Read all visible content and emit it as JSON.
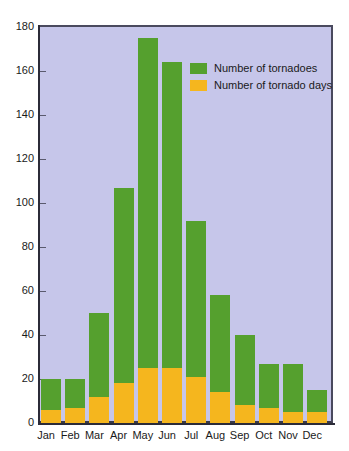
{
  "chart_data": {
    "type": "bar",
    "stacked": true,
    "title": "",
    "xlabel": "",
    "ylabel": "",
    "ylim": [
      0,
      180
    ],
    "ytick_step": 20,
    "yticks": [
      0,
      20,
      40,
      60,
      80,
      100,
      120,
      140,
      160,
      180
    ],
    "grid": false,
    "legend_position": "top-right",
    "categories": [
      "Jan",
      "Feb",
      "Mar",
      "Apr",
      "May",
      "Jun",
      "Jul",
      "Aug",
      "Sep",
      "Oct",
      "Nov",
      "Dec"
    ],
    "series": [
      {
        "name": "Number of tornadoes",
        "color": "#55a02e",
        "values": [
          20,
          20,
          50,
          107,
          175,
          164,
          92,
          58,
          40,
          27,
          27,
          15
        ]
      },
      {
        "name": "Number of tornado days",
        "color": "#f5b61e",
        "values": [
          6,
          7,
          12,
          18,
          25,
          25,
          21,
          14,
          8,
          7,
          5,
          5
        ]
      }
    ]
  },
  "legend": {
    "items": [
      {
        "label": "Number of tornadoes",
        "color": "#55a02e"
      },
      {
        "label": "Number of tornado days",
        "color": "#f5b61e"
      }
    ]
  },
  "axes": {
    "y_tick_labels": [
      "0",
      "20",
      "40",
      "60",
      "80",
      "100",
      "120",
      "140",
      "160",
      "180"
    ],
    "x_tick_labels": [
      "Jan",
      "Feb",
      "Mar",
      "Apr",
      "May",
      "Jun",
      "Jul",
      "Aug",
      "Sep",
      "Oct",
      "Nov",
      "Dec"
    ]
  },
  "style": {
    "plot_background": "#c6c6ea",
    "page_background": "#ffffff",
    "axis_color": "#2b2b38"
  }
}
